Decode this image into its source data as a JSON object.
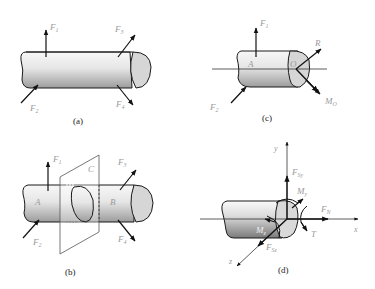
{
  "figure": {
    "panels": [
      {
        "id": "a",
        "caption": "(a)",
        "labels": {
          "f1": "F",
          "f1_sub": "1",
          "f2": "F",
          "f2_sub": "2",
          "f3": "F",
          "f3_sub": "3",
          "f4": "F",
          "f4_sub": "4"
        }
      },
      {
        "id": "b",
        "caption": "(b)",
        "labels": {
          "f1": "F",
          "f1_sub": "1",
          "f2": "F",
          "f2_sub": "2",
          "f3": "F",
          "f3_sub": "3",
          "f4": "F",
          "f4_sub": "4",
          "section": "C",
          "left": "A",
          "right": "B"
        }
      },
      {
        "id": "c",
        "caption": "(c)",
        "labels": {
          "f1": "F",
          "f1_sub": "1",
          "f2": "F",
          "f2_sub": "2",
          "point_a": "A",
          "point_o": "O",
          "resultant": "R",
          "moment": "M",
          "moment_sub": "O"
        }
      },
      {
        "id": "d",
        "caption": "(d)",
        "labels": {
          "y": "y",
          "x": "x",
          "z": "z",
          "fsy": "F",
          "fsy_sub": "Sy",
          "fsz": "F",
          "fsz_sub": "Sz",
          "fn": "F",
          "fn_sub": "N",
          "my": "M",
          "my_sub": "y",
          "mz": "M",
          "mz_sub": "z",
          "t": "T"
        }
      }
    ],
    "colors": {
      "outline": "#1a1a1a",
      "label": "#9a9a9a",
      "shade_light": "#f2f2f2",
      "shade_dark": "#9c9c9c",
      "end_face": "#d6d6d6"
    }
  }
}
